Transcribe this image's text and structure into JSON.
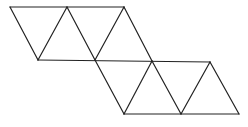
{
  "diagram": {
    "type": "triangular-net",
    "stroke_color": "#222222",
    "background": "#ffffff",
    "vertices": {
      "A": [
        10,
        7
      ],
      "B": [
        67,
        7
      ],
      "C": [
        124,
        7
      ],
      "D": [
        38,
        60
      ],
      "E": [
        95,
        60
      ],
      "F": [
        152,
        61
      ],
      "G": [
        210,
        62
      ],
      "H": [
        124,
        114
      ],
      "I": [
        181,
        114
      ],
      "J": [
        239,
        114
      ]
    },
    "edges": [
      [
        "A",
        "C"
      ],
      [
        "A",
        "D"
      ],
      [
        "D",
        "B"
      ],
      [
        "B",
        "E"
      ],
      [
        "E",
        "C"
      ],
      [
        "C",
        "F"
      ],
      [
        "D",
        "G"
      ],
      [
        "E",
        "H"
      ],
      [
        "H",
        "F"
      ],
      [
        "F",
        "I"
      ],
      [
        "I",
        "G"
      ],
      [
        "G",
        "J"
      ],
      [
        "H",
        "J"
      ]
    ],
    "triangle_count": 8
  }
}
